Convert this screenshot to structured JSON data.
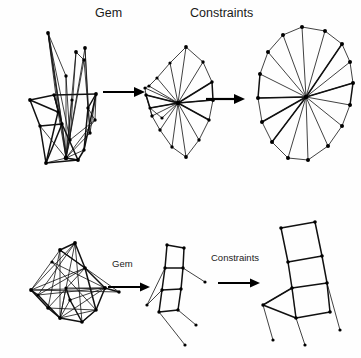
{
  "figure": {
    "background_color": "#fefefe",
    "ink_color": "#111111",
    "width": 361,
    "height": 358
  },
  "labels": {
    "top_row": {
      "gem": "Gem",
      "constraints": "Constraints"
    },
    "bottom_row": {
      "gem": "Gem",
      "constraints": "Constraints"
    }
  },
  "rows": [
    {
      "name": "wheel-graph-row",
      "stages": [
        {
          "name": "tangled-initial-layout",
          "caption": ""
        },
        {
          "name": "gem-relaxed-layout",
          "caption": ""
        },
        {
          "name": "constraint-satisfied-wheel",
          "caption": ""
        }
      ],
      "arrows": [
        {
          "name": "gem-arrow",
          "label": "Gem"
        },
        {
          "name": "constraints-arrow",
          "label": "Constraints"
        }
      ]
    },
    {
      "name": "ladder-graph-row",
      "stages": [
        {
          "name": "tangled-initial-layout",
          "caption": ""
        },
        {
          "name": "gem-relaxed-layout",
          "caption": ""
        },
        {
          "name": "constraint-satisfied-ladder",
          "caption": ""
        }
      ],
      "arrows": [
        {
          "name": "gem-arrow",
          "label": "Gem"
        },
        {
          "name": "constraints-arrow",
          "label": "Constraints"
        }
      ]
    }
  ],
  "graph_geometry": {
    "top_left_tangle": {
      "nodes": [
        [
          48,
          33
        ],
        [
          76,
          52
        ],
        [
          66,
          76
        ],
        [
          84,
          60
        ],
        [
          85,
          48
        ],
        [
          30,
          100
        ],
        [
          54,
          95
        ],
        [
          96,
          94
        ],
        [
          88,
          108
        ],
        [
          62,
          124
        ],
        [
          40,
          126
        ],
        [
          70,
          140
        ],
        [
          78,
          160
        ],
        [
          46,
          163
        ],
        [
          84,
          150
        ],
        [
          95,
          120
        ],
        [
          58,
          112
        ],
        [
          72,
          100
        ],
        [
          66,
          158
        ],
        [
          90,
          133
        ]
      ],
      "edges": [
        [
          0,
          18
        ],
        [
          0,
          13
        ],
        [
          0,
          11
        ],
        [
          4,
          18
        ],
        [
          4,
          11
        ],
        [
          4,
          8
        ],
        [
          1,
          18
        ],
        [
          1,
          11
        ],
        [
          2,
          18
        ],
        [
          2,
          11
        ],
        [
          3,
          18
        ],
        [
          3,
          8
        ],
        [
          5,
          6
        ],
        [
          5,
          10
        ],
        [
          6,
          7
        ],
        [
          6,
          16
        ],
        [
          7,
          8
        ],
        [
          7,
          15
        ],
        [
          8,
          15
        ],
        [
          9,
          18
        ],
        [
          10,
          13
        ],
        [
          10,
          18
        ],
        [
          11,
          18
        ],
        [
          12,
          18
        ],
        [
          13,
          18
        ],
        [
          14,
          18
        ],
        [
          15,
          19
        ],
        [
          16,
          18
        ],
        [
          17,
          18
        ],
        [
          19,
          18
        ],
        [
          5,
          16
        ],
        [
          6,
          9
        ],
        [
          9,
          14
        ],
        [
          12,
          14
        ],
        [
          13,
          12
        ],
        [
          10,
          12
        ],
        [
          7,
          19
        ],
        [
          2,
          9
        ],
        [
          1,
          3
        ],
        [
          0,
          2
        ],
        [
          16,
          9
        ],
        [
          17,
          9
        ],
        [
          11,
          15
        ],
        [
          8,
          19
        ]
      ]
    },
    "top_middle_fan": {
      "hub": [
        178,
        103
      ],
      "outer_nodes": [
        [
          186,
          47
        ],
        [
          203,
          62
        ],
        [
          212,
          82
        ],
        [
          213,
          100
        ],
        [
          209,
          120
        ],
        [
          199,
          140
        ],
        [
          186,
          157
        ],
        [
          172,
          147
        ],
        [
          160,
          130
        ],
        [
          152,
          116
        ],
        [
          146,
          95
        ],
        [
          149,
          86
        ],
        [
          157,
          78
        ],
        [
          170,
          63
        ]
      ],
      "extra_nodes": [
        [
          145,
          88
        ],
        [
          150,
          108
        ],
        [
          162,
          118
        ]
      ]
    },
    "top_right_wheel": {
      "hub": [
        306,
        97
      ],
      "outer_nodes": [
        [
          302,
          27
        ],
        [
          325,
          31
        ],
        [
          342,
          44
        ],
        [
          350,
          62
        ],
        [
          353,
          83
        ],
        [
          350,
          105
        ],
        [
          342,
          126
        ],
        [
          328,
          146
        ],
        [
          308,
          160
        ],
        [
          288,
          158
        ],
        [
          272,
          142
        ],
        [
          262,
          122
        ],
        [
          258,
          98
        ],
        [
          260,
          74
        ],
        [
          268,
          52
        ],
        [
          283,
          35
        ]
      ]
    },
    "bottom_left_tangle": {
      "nodes": [
        [
          60,
          250
        ],
        [
          75,
          243
        ],
        [
          52,
          262
        ],
        [
          85,
          268
        ],
        [
          31,
          290
        ],
        [
          105,
          288
        ],
        [
          70,
          300
        ],
        [
          48,
          308
        ],
        [
          96,
          310
        ],
        [
          60,
          318
        ],
        [
          82,
          322
        ],
        [
          119,
          292
        ],
        [
          38,
          295
        ],
        [
          66,
          288
        ]
      ]
    },
    "bottom_middle_ladder": {
      "nodes": [
        [
          167,
          245
        ],
        [
          184,
          248
        ],
        [
          165,
          268
        ],
        [
          183,
          268
        ],
        [
          162,
          290
        ],
        [
          181,
          289
        ],
        [
          159,
          312
        ],
        [
          178,
          310
        ],
        [
          147,
          305
        ],
        [
          205,
          282
        ],
        [
          196,
          325
        ],
        [
          185,
          345
        ]
      ]
    },
    "bottom_right_ladder": {
      "nodes": [
        [
          281,
          228
        ],
        [
          315,
          222
        ],
        [
          288,
          262
        ],
        [
          322,
          256
        ],
        [
          292,
          288
        ],
        [
          327,
          283
        ],
        [
          296,
          318
        ],
        [
          330,
          312
        ],
        [
          263,
          305
        ],
        [
          273,
          340
        ],
        [
          305,
          345
        ],
        [
          340,
          330
        ]
      ]
    }
  },
  "arrow_positions": {
    "top_first": {
      "x1": 103,
      "y1": 92,
      "x2": 141,
      "y2": 92
    },
    "top_second": {
      "x1": 206,
      "y1": 99,
      "x2": 241,
      "y2": 99
    },
    "bottom_first": {
      "x1": 108,
      "y1": 287,
      "x2": 148,
      "y2": 287
    },
    "bottom_second": {
      "x1": 218,
      "y1": 283,
      "x2": 258,
      "y2": 283
    }
  }
}
